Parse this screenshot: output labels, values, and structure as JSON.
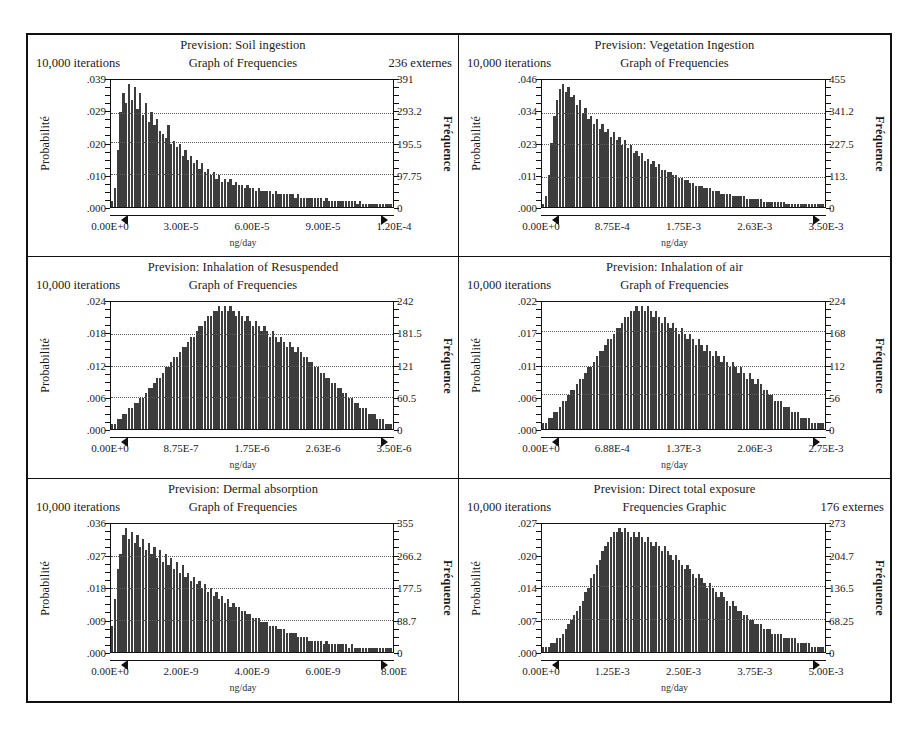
{
  "figure": {
    "panel_count": 6,
    "axis_titles": {
      "left": "Probabilité",
      "right": "Fréquence"
    },
    "x_unit": "ng/day"
  },
  "chart_data": [
    {
      "type": "bar",
      "title": "Prevision: Soil ingestion",
      "subtitle": "Graph of Frequencies",
      "iterations": "10,000 iterations",
      "extremes": "236 externes",
      "xlabel": "ng/day",
      "ylabel": "Probabilité",
      "y2label": "Fréquence",
      "xticks": [
        "0.00E+0",
        "3.00E-5",
        "6.00E-5",
        "9.00E-5",
        "1.20E-4"
      ],
      "yticks": [
        ".039",
        ".029",
        ".020",
        ".010",
        ".000"
      ],
      "y2ticks": [
        "391",
        "293.2",
        "195.5",
        "97.75",
        "0"
      ],
      "xlim": [
        0,
        0.00012
      ],
      "ylim": [
        0,
        0.039
      ],
      "y2lim": [
        0,
        391
      ],
      "gridlines": [
        0.029,
        0.02,
        0.01
      ],
      "shape": "right-skewed",
      "values": [
        2,
        6,
        18,
        30,
        36,
        33,
        39,
        34,
        38,
        31,
        36,
        29,
        33,
        27,
        30,
        26,
        28,
        24,
        23,
        22,
        26,
        20,
        21,
        19,
        20,
        16,
        18,
        15,
        16,
        14,
        15,
        12,
        14,
        11,
        12,
        10,
        11,
        9,
        10,
        8,
        9,
        8,
        9,
        7,
        8,
        7,
        7,
        6,
        7,
        6,
        6,
        5,
        6,
        5,
        5,
        5,
        5,
        4,
        5,
        4,
        4,
        4,
        4,
        4,
        4,
        3,
        4,
        3,
        3,
        3,
        3,
        3,
        3,
        3,
        3,
        2,
        3,
        2,
        2,
        2,
        2,
        2,
        2,
        2,
        2,
        2,
        2,
        1,
        2,
        1,
        1,
        1,
        1,
        1,
        1,
        1,
        1,
        1,
        1,
        1
      ]
    },
    {
      "type": "bar",
      "title": "Prevision: Vegetation Ingestion",
      "subtitle": "Graph of Frequencies",
      "iterations": "10,000 iterations",
      "extremes": "",
      "xlabel": "ng/day",
      "ylabel": "Probabilité",
      "y2label": "Fréquence",
      "xticks": [
        "0.00E+0",
        "8.75E-4",
        "1.75E-3",
        "2.63E-3",
        "3.50E-3"
      ],
      "yticks": [
        ".046",
        ".034",
        ".023",
        ".011",
        ".000"
      ],
      "y2ticks": [
        "455",
        "341.2",
        "227.5",
        "113.",
        "0"
      ],
      "xlim": [
        0,
        0.0035
      ],
      "ylim": [
        0,
        0.046
      ],
      "y2lim": [
        0,
        455
      ],
      "gridlines": [
        0.034,
        0.023,
        0.011
      ],
      "shape": "right-skewed",
      "values": [
        1,
        4,
        12,
        24,
        34,
        40,
        44,
        46,
        43,
        45,
        41,
        42,
        38,
        40,
        35,
        37,
        33,
        34,
        31,
        33,
        29,
        31,
        28,
        29,
        26,
        28,
        25,
        26,
        23,
        25,
        22,
        23,
        20,
        21,
        19,
        20,
        17,
        18,
        16,
        17,
        15,
        16,
        14,
        14,
        13,
        13,
        12,
        12,
        11,
        11,
        10,
        10,
        9,
        9,
        8,
        8,
        8,
        7,
        7,
        7,
        6,
        6,
        6,
        5,
        5,
        5,
        5,
        4,
        4,
        4,
        4,
        4,
        3,
        3,
        3,
        3,
        3,
        3,
        2,
        2,
        2,
        2,
        2,
        2,
        2,
        2,
        1,
        1,
        1,
        1,
        1,
        1,
        1,
        1,
        1,
        1,
        1,
        1,
        1,
        1
      ]
    },
    {
      "type": "bar",
      "title": "Prevision: Inhalation of Resuspended",
      "subtitle": "Graph of Frequencies",
      "iterations": "10,000 iterations",
      "extremes": "",
      "xlabel": "ng/day",
      "ylabel": "Probabilité",
      "y2label": "Fréquence",
      "xticks": [
        "0.00E+0",
        "8.75E-7",
        "1.75E-6",
        "2.63E-6",
        "3.50E-6"
      ],
      "yticks": [
        ".024",
        ".018",
        ".012",
        ".006",
        ".000"
      ],
      "y2ticks": [
        "242",
        "181.5",
        "121",
        "60.5",
        "0"
      ],
      "xlim": [
        0,
        3.5e-06
      ],
      "ylim": [
        0,
        0.024
      ],
      "y2lim": [
        0,
        242
      ],
      "gridlines": [
        0.018,
        0.012,
        0.006
      ],
      "shape": "unimodal-peak-center",
      "values": [
        1,
        1,
        2,
        2,
        3,
        3,
        4,
        4,
        5,
        5,
        6,
        6,
        7,
        8,
        8,
        9,
        10,
        10,
        11,
        12,
        12,
        13,
        14,
        14,
        15,
        16,
        16,
        17,
        18,
        18,
        19,
        20,
        20,
        21,
        22,
        22,
        23,
        23,
        24,
        23,
        24,
        23,
        24,
        23,
        22,
        23,
        22,
        21,
        22,
        21,
        20,
        21,
        20,
        19,
        20,
        19,
        18,
        19,
        18,
        17,
        18,
        17,
        16,
        17,
        16,
        15,
        16,
        15,
        14,
        14,
        13,
        13,
        12,
        12,
        11,
        11,
        10,
        10,
        9,
        9,
        8,
        8,
        7,
        7,
        6,
        6,
        5,
        5,
        4,
        4,
        4,
        3,
        3,
        3,
        2,
        2,
        2,
        1,
        1,
        1
      ]
    },
    {
      "type": "bar",
      "title": "Prevision: Inhalation of air",
      "subtitle": "Graph of Frequencies",
      "iterations": "10,000 iterations",
      "extremes": "",
      "xlabel": "ng/day",
      "ylabel": "Probabilité",
      "y2label": "Fréquence",
      "xticks": [
        "0.00E+0",
        "6.88E-4",
        "1.37E-3",
        "2.06E-3",
        "2.75E-3"
      ],
      "yticks": [
        ".022",
        ".017",
        ".011",
        ".006",
        ".000"
      ],
      "y2ticks": [
        "224",
        "168",
        "112",
        "56",
        "0"
      ],
      "xlim": [
        0,
        0.00275
      ],
      "ylim": [
        0,
        0.022
      ],
      "y2lim": [
        0,
        224
      ],
      "gridlines": [
        0.017,
        0.011,
        0.006
      ],
      "shape": "unimodal-peak-center",
      "values": [
        1,
        1,
        2,
        2,
        3,
        3,
        4,
        5,
        5,
        6,
        7,
        7,
        8,
        9,
        9,
        10,
        11,
        11,
        12,
        13,
        14,
        14,
        15,
        16,
        16,
        17,
        18,
        18,
        19,
        20,
        20,
        21,
        21,
        22,
        21,
        22,
        21,
        22,
        21,
        20,
        21,
        20,
        19,
        20,
        19,
        18,
        19,
        18,
        17,
        18,
        17,
        16,
        17,
        16,
        15,
        16,
        15,
        14,
        15,
        14,
        13,
        14,
        13,
        12,
        13,
        12,
        11,
        12,
        11,
        10,
        11,
        10,
        9,
        10,
        9,
        8,
        9,
        8,
        7,
        7,
        6,
        6,
        5,
        5,
        5,
        4,
        4,
        4,
        3,
        3,
        3,
        2,
        2,
        2,
        2,
        1,
        1,
        1,
        1,
        1
      ]
    },
    {
      "type": "bar",
      "title": "Prevision: Dermal absorption",
      "subtitle": "Graph of Frequencies",
      "iterations": "10,000 iterations",
      "extremes": "",
      "xlabel": "ng/day",
      "ylabel": "Probabilité",
      "y2label": "Fréquence",
      "xticks": [
        "0.00E+0",
        "2.00E-9",
        "4.00E-9",
        "6.00E-9",
        "8.00E"
      ],
      "yticks": [
        ".036",
        ".027",
        ".018",
        ".009",
        ".000"
      ],
      "y2ticks": [
        "355",
        "266.2",
        "177.5",
        "88.7",
        "0"
      ],
      "xlim": [
        0,
        8e-09
      ],
      "ylim": [
        0,
        0.036
      ],
      "y2lim": [
        0,
        355
      ],
      "gridlines": [
        0.027,
        0.018,
        0.009
      ],
      "shape": "right-skewed",
      "values": [
        7,
        14,
        22,
        26,
        31,
        33,
        30,
        32,
        29,
        31,
        28,
        30,
        27,
        29,
        26,
        28,
        25,
        27,
        24,
        26,
        23,
        25,
        22,
        24,
        21,
        23,
        20,
        21,
        19,
        20,
        18,
        19,
        17,
        18,
        16,
        17,
        15,
        16,
        14,
        15,
        13,
        14,
        12,
        13,
        12,
        12,
        11,
        11,
        10,
        10,
        9,
        9,
        9,
        8,
        8,
        8,
        7,
        7,
        7,
        6,
        6,
        6,
        5,
        5,
        5,
        5,
        4,
        4,
        4,
        4,
        3,
        3,
        3,
        3,
        3,
        2,
        3,
        2,
        2,
        2,
        2,
        2,
        2,
        2,
        1,
        2,
        1,
        1,
        1,
        1,
        1,
        1,
        1,
        1,
        1,
        1,
        1,
        1,
        1,
        1
      ]
    },
    {
      "type": "bar",
      "title": "Prevision: Direct total exposure",
      "subtitle": "Frequencies Graphic",
      "iterations": "10,000 iterations",
      "extremes": "176 externes",
      "xlabel": "ng/day",
      "ylabel": "Probabilité",
      "y2label": "Fréquence",
      "xticks": [
        "0.00E+0",
        "1.25E-3",
        "2.50E-3",
        "3.75E-3",
        "5.00E-3"
      ],
      "yticks": [
        ".027",
        ".020",
        ".014",
        ".007",
        ".000"
      ],
      "y2ticks": [
        "273",
        "204.7",
        "136.5",
        "68.25",
        "0"
      ],
      "xlim": [
        0,
        0.005
      ],
      "ylim": [
        0,
        0.027
      ],
      "y2lim": [
        0,
        273
      ],
      "gridlines": [
        0.014,
        0.007
      ],
      "shape": "unimodal-peak-left-center",
      "values": [
        1,
        1,
        1,
        2,
        2,
        3,
        3,
        4,
        5,
        6,
        7,
        8,
        9,
        10,
        11,
        13,
        14,
        16,
        17,
        19,
        20,
        22,
        23,
        24,
        25,
        26,
        26,
        27,
        26,
        27,
        26,
        25,
        26,
        25,
        26,
        25,
        24,
        25,
        24,
        23,
        24,
        23,
        22,
        23,
        22,
        21,
        20,
        21,
        20,
        19,
        18,
        19,
        18,
        17,
        16,
        17,
        16,
        15,
        14,
        15,
        14,
        13,
        12,
        13,
        12,
        11,
        10,
        11,
        10,
        9,
        9,
        8,
        8,
        7,
        7,
        6,
        6,
        6,
        5,
        5,
        5,
        4,
        4,
        4,
        4,
        3,
        3,
        3,
        3,
        3,
        2,
        2,
        2,
        2,
        2,
        1,
        1,
        1,
        1,
        1
      ]
    }
  ]
}
